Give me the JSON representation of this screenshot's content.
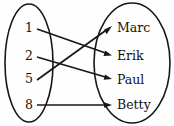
{
  "diagram": {
    "type": "mapping-diagram",
    "background_color": "#fefefe",
    "ink_color": "#171717",
    "domain_set": {
      "name": "left-set",
      "shape": "ellipse",
      "cx": 29,
      "cy": 63,
      "rx": 24,
      "ry": 59,
      "items": [
        {
          "id": "d1",
          "label": "1",
          "x": 29,
          "y": 28
        },
        {
          "id": "d2",
          "label": "2",
          "x": 29,
          "y": 56
        },
        {
          "id": "d3",
          "label": "5",
          "x": 29,
          "y": 79
        },
        {
          "id": "d4",
          "label": "8",
          "x": 29,
          "y": 105
        }
      ]
    },
    "codomain_set": {
      "name": "right-set",
      "shape": "ellipse",
      "cx": 132,
      "cy": 63,
      "rx": 38,
      "ry": 60,
      "items": [
        {
          "id": "c1",
          "label": "Marc",
          "x": 117,
          "y": 28
        },
        {
          "id": "c2",
          "label": "Erik",
          "x": 117,
          "y": 56
        },
        {
          "id": "c3",
          "label": "Paul",
          "x": 117,
          "y": 80
        },
        {
          "id": "c4",
          "label": "Betty",
          "x": 117,
          "y": 105
        }
      ]
    },
    "arrows": [
      {
        "id": "a1",
        "from": "1",
        "to": "Erik",
        "x1": 37,
        "y1": 29,
        "x2": 112,
        "y2": 55
      },
      {
        "id": "a2",
        "from": "2",
        "to": "Paul",
        "x1": 37,
        "y1": 57,
        "x2": 112,
        "y2": 79
      },
      {
        "id": "a3",
        "from": "5",
        "to": "Marc",
        "x1": 37,
        "y1": 80,
        "x2": 112,
        "y2": 27
      },
      {
        "id": "a4",
        "from": "8",
        "to": "Betty",
        "x1": 37,
        "y1": 105,
        "x2": 112,
        "y2": 105
      }
    ],
    "mapping_pairs": [
      {
        "input": "1",
        "output": "Erik"
      },
      {
        "input": "2",
        "output": "Paul"
      },
      {
        "input": "5",
        "output": "Marc"
      },
      {
        "input": "8",
        "output": "Betty"
      }
    ]
  }
}
